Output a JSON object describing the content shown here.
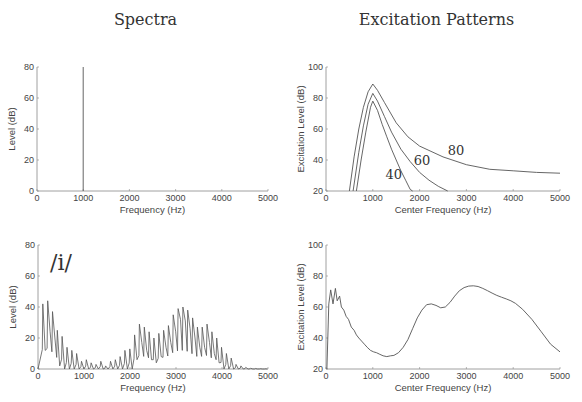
{
  "titles": {
    "left": "Spectra",
    "right": "Excitation Patterns"
  },
  "chart_data": [
    {
      "id": "spectrum-tone",
      "type": "line",
      "title": "",
      "xlabel": "Frequency (Hz)",
      "ylabel": "Level (dB)",
      "xlim": [
        0,
        5000
      ],
      "ylim": [
        0,
        80
      ],
      "xticks": [
        0,
        1000,
        2000,
        3000,
        4000,
        5000
      ],
      "yticks": [
        0,
        20,
        40,
        60,
        80
      ],
      "grid": false,
      "box": [
        37,
        67,
        268,
        191
      ],
      "series": [
        {
          "name": "1000 Hz tone",
          "x": [
            1000,
            1000
          ],
          "y": [
            0,
            80
          ]
        }
      ],
      "annotations": []
    },
    {
      "id": "excitation-tone",
      "type": "line",
      "title": "",
      "xlabel": "Center Frequency (Hz)",
      "ylabel": "Excitation Level (dB)",
      "xlim": [
        0,
        5000
      ],
      "ylim": [
        20,
        100
      ],
      "xticks": [
        0,
        1000,
        2000,
        3000,
        4000,
        5000
      ],
      "yticks": [
        20,
        40,
        60,
        80,
        100
      ],
      "grid": false,
      "box": [
        326,
        67,
        560,
        191
      ],
      "series": [
        {
          "name": "40",
          "x": [
            650,
            750,
            850,
            950,
            1000,
            1100,
            1200,
            1300,
            1400,
            1500,
            1600,
            1700,
            1800,
            1850
          ],
          "y": [
            20,
            40,
            58,
            74,
            78,
            72,
            63,
            55,
            47,
            40,
            33,
            27,
            21,
            20
          ]
        },
        {
          "name": "60",
          "x": [
            580,
            700,
            800,
            900,
            1000,
            1100,
            1250,
            1400,
            1600,
            1800,
            2000,
            2200,
            2400,
            2600
          ],
          "y": [
            20,
            45,
            62,
            76,
            83,
            78,
            68,
            58,
            47,
            39,
            32,
            27,
            23,
            20
          ]
        },
        {
          "name": "80",
          "x": [
            500,
            600,
            700,
            800,
            900,
            1000,
            1100,
            1250,
            1500,
            1750,
            2000,
            2500,
            3000,
            3500,
            4000,
            4500,
            5000
          ],
          "y": [
            20,
            42,
            60,
            74,
            84,
            89,
            85,
            77,
            64,
            55,
            49,
            42,
            37,
            34,
            33,
            32,
            31.5
          ]
        }
      ],
      "annotations": [
        {
          "text": "40",
          "x": 1450,
          "y": 28
        },
        {
          "text": "60",
          "x": 2050,
          "y": 37
        },
        {
          "text": "80",
          "x": 2780,
          "y": 43.5
        }
      ]
    },
    {
      "id": "spectrum-vowel-i",
      "type": "line",
      "title": "",
      "xlabel": "Frequency (Hz)",
      "ylabel": "Level (dB)",
      "xlim": [
        0,
        5000
      ],
      "ylim": [
        0,
        80
      ],
      "xticks": [
        0,
        1000,
        2000,
        3000,
        4000,
        5000
      ],
      "yticks": [
        0,
        20,
        40,
        60,
        80
      ],
      "grid": false,
      "box": [
        38,
        245,
        268,
        369
      ],
      "f0": 105,
      "harmonic_levels": [
        42,
        44,
        37,
        25,
        21,
        14,
        12,
        10,
        5,
        6,
        4,
        3,
        5,
        2,
        5,
        6,
        8,
        12,
        13,
        22,
        29,
        27,
        24,
        20,
        23,
        25,
        28,
        35,
        39,
        40,
        38,
        33,
        27,
        27,
        29,
        24,
        20,
        14,
        10,
        7,
        3,
        2,
        1,
        0.5,
        0.3,
        0.2,
        0.1
      ],
      "valley_levels": [
        12,
        24,
        20,
        2,
        0,
        0,
        0,
        0,
        0,
        0,
        0,
        0,
        0,
        0,
        0,
        0,
        0,
        0,
        0,
        6,
        17,
        12,
        6,
        4,
        8,
        14,
        17,
        24,
        32,
        31,
        26,
        20,
        14,
        14,
        17,
        10,
        4,
        0,
        0,
        0,
        0,
        0,
        0,
        0,
        0,
        0
      ],
      "annotations": [
        {
          "text": "/i/",
          "x": 500,
          "y": 64
        }
      ]
    },
    {
      "id": "excitation-vowel-i",
      "type": "line",
      "title": "",
      "xlabel": "Center Frequency (Hz)",
      "ylabel": "Excitation Level (dB)",
      "xlim": [
        0,
        5000
      ],
      "ylim": [
        20,
        100
      ],
      "xticks": [
        0,
        1000,
        2000,
        3000,
        4000,
        5000
      ],
      "yticks": [
        20,
        40,
        60,
        80,
        100
      ],
      "grid": false,
      "box": [
        326,
        245,
        560,
        369
      ],
      "series": [
        {
          "name": "/i/ excitation",
          "x": [
            20,
            60,
            100,
            150,
            200,
            240,
            290,
            330,
            380,
            430,
            480,
            540,
            600,
            650,
            700,
            760,
            820,
            880,
            950,
            1020,
            1080,
            1150,
            1220,
            1300,
            1380,
            1450,
            1550,
            1650,
            1750,
            1850,
            1950,
            2050,
            2150,
            2250,
            2350,
            2450,
            2550,
            2650,
            2750,
            2850,
            2950,
            3050,
            3150,
            3250,
            3350,
            3450,
            3550,
            3650,
            3750,
            3850,
            3950,
            4050,
            4200,
            4400,
            4600,
            4800,
            5000
          ],
          "y": [
            20,
            62,
            71,
            62,
            72,
            64,
            67,
            60,
            58,
            54,
            52,
            47,
            45,
            42,
            40,
            38,
            36,
            34,
            32,
            31,
            30.5,
            29.5,
            28.5,
            28,
            28.5,
            28.8,
            30.5,
            34,
            39,
            46,
            53,
            58,
            61.5,
            62,
            61,
            59.5,
            60,
            63,
            67,
            70.5,
            72.5,
            73.5,
            73.7,
            73.2,
            72,
            70.5,
            69,
            67.5,
            66.3,
            65.2,
            64,
            62.3,
            58.5,
            52,
            44,
            36,
            31
          ]
        }
      ],
      "annotations": []
    }
  ]
}
